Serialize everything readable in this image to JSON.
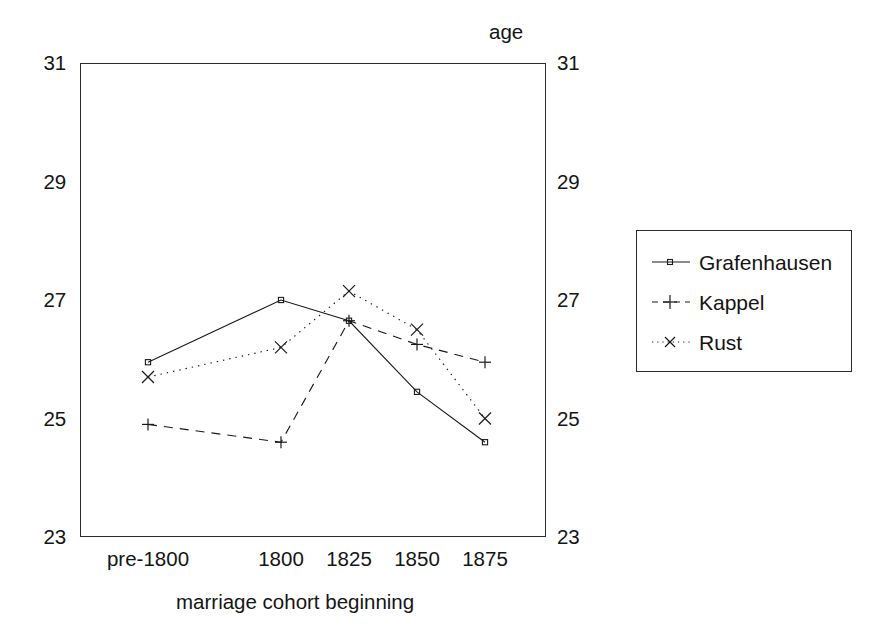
{
  "chart_data": {
    "type": "line",
    "title": "",
    "xlabel": "marriage cohort beginning",
    "ylabel": "age",
    "categories": [
      "pre-1800",
      "1800",
      "1825",
      "1850",
      "1875"
    ],
    "ylim": [
      23,
      31
    ],
    "yticks": [
      23,
      25,
      27,
      29,
      31
    ],
    "ytick_labels": [
      "23",
      "25",
      "27",
      "29",
      "31"
    ],
    "y_axis_both_sides": true,
    "grid": false,
    "legend_position": "right-outside",
    "series": [
      {
        "name": "Grafenhausen",
        "marker": "square",
        "linestyle": "solid",
        "color": "#1a1a1a",
        "values": [
          25.95,
          27.0,
          26.65,
          25.45,
          24.6
        ]
      },
      {
        "name": "Kappel",
        "marker": "plus",
        "linestyle": "dashed",
        "color": "#1a1a1a",
        "values": [
          24.9,
          24.6,
          26.65,
          26.25,
          25.95
        ]
      },
      {
        "name": "Rust",
        "marker": "cross",
        "linestyle": "dotted",
        "color": "#1a1a1a",
        "values": [
          25.7,
          26.2,
          27.15,
          26.5,
          25.0
        ]
      }
    ]
  },
  "axes": {
    "y_label": "age",
    "x_label": "marriage cohort beginning",
    "y_ticks_left": [
      "31",
      "29",
      "27",
      "25",
      "23"
    ],
    "y_ticks_right": [
      "31",
      "29",
      "27",
      "25",
      "23"
    ],
    "x_ticks": [
      "pre-1800",
      "1800",
      "1825",
      "1850",
      "1875"
    ]
  },
  "legend": {
    "entries": [
      {
        "label": "Grafenhausen",
        "marker": "square-marker",
        "linestyle": "solid"
      },
      {
        "label": "Kappel",
        "marker": "plus-marker",
        "linestyle": "dashed"
      },
      {
        "label": "Rust",
        "marker": "cross-marker",
        "linestyle": "dotted"
      }
    ]
  }
}
